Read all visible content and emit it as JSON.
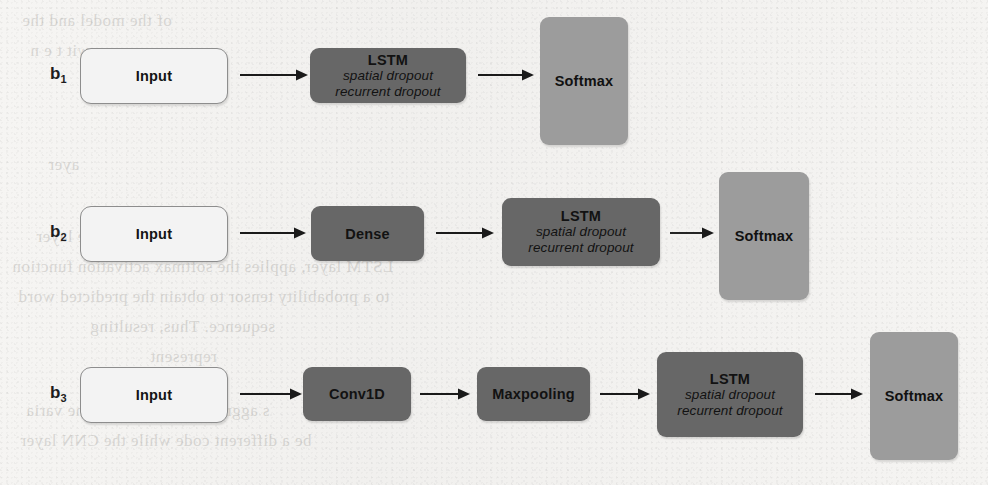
{
  "figure": {
    "type": "diagram",
    "kind": "neural-network-architecture-flowchart",
    "rows": [
      {
        "label": "b",
        "label_sub": "1",
        "nodes": [
          {
            "id": "b1-input",
            "title": "Input",
            "sub1": "",
            "sub2": "",
            "style": "input"
          },
          {
            "id": "b1-lstm",
            "title": "LSTM",
            "sub1": "spatial dropout",
            "sub2": "recurrent dropout",
            "style": "dark"
          },
          {
            "id": "b1-softmax",
            "title": "Softmax",
            "sub1": "",
            "sub2": "",
            "style": "light"
          }
        ]
      },
      {
        "label": "b",
        "label_sub": "2",
        "nodes": [
          {
            "id": "b2-input",
            "title": "Input",
            "sub1": "",
            "sub2": "",
            "style": "input"
          },
          {
            "id": "b2-dense",
            "title": "Dense",
            "sub1": "",
            "sub2": "",
            "style": "dark"
          },
          {
            "id": "b2-lstm",
            "title": "LSTM",
            "sub1": "spatial dropout",
            "sub2": "recurrent dropout",
            "style": "dark"
          },
          {
            "id": "b2-softmax",
            "title": "Softmax",
            "sub1": "",
            "sub2": "",
            "style": "light"
          }
        ]
      },
      {
        "label": "b",
        "label_sub": "3",
        "nodes": [
          {
            "id": "b3-input",
            "title": "Input",
            "sub1": "",
            "sub2": "",
            "style": "input"
          },
          {
            "id": "b3-conv",
            "title": "Conv1D",
            "sub1": "",
            "sub2": "",
            "style": "dark"
          },
          {
            "id": "b3-maxpool",
            "title": "Maxpooling",
            "sub1": "",
            "sub2": "",
            "style": "dark"
          },
          {
            "id": "b3-lstm",
            "title": "LSTM",
            "sub1": "spatial dropout",
            "sub2": "recurrent dropout",
            "style": "dark"
          },
          {
            "id": "b3-softmax",
            "title": "Softmax",
            "sub1": "",
            "sub2": "",
            "style": "light"
          }
        ]
      }
    ]
  },
  "colors": {
    "page_background": "#f4f3f1",
    "input_fill": "#f3f3f3",
    "input_border": "#8d8d8d",
    "dark_fill": "#676767",
    "light_fill": "#9c9c9c",
    "text": "#141414",
    "arrow": "#1a1a1a"
  },
  "bleed_text": {
    "lines": [
      "of the model and the",
      "er ayer  wit t e  n",
      "ul",
      "ayer",
      "dense layer",
      "LSTM layer, applies the softmax activation function",
      "to a probability tensor to obtain the predicted word",
      "sequence. Thus, resulting",
      "represent",
      "s aggregation of each of the varia",
      "be a different code  while the  CNN  layer"
    ]
  }
}
